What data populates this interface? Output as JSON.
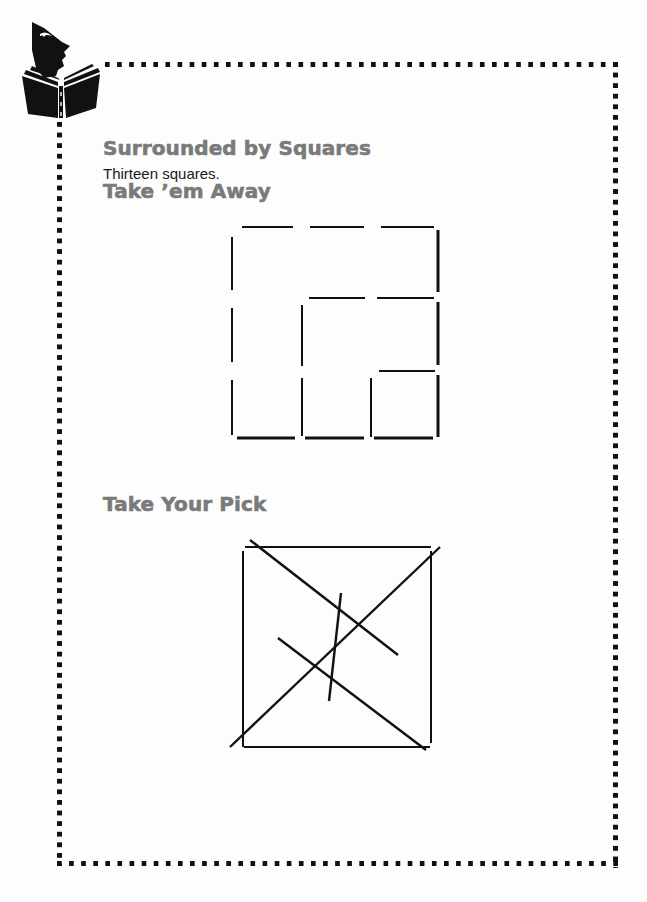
{
  "page": {
    "sections": [
      {
        "title": "Surrounded by Squares",
        "answer": "Thirteen squares."
      },
      {
        "title": "Take ’em Away"
      },
      {
        "title": "Take Your Pick"
      }
    ],
    "logo_icon": "person-reading-book-icon",
    "border_style": "dotted-square",
    "colors": {
      "heading": "#7a7a7a",
      "text": "#1a1a1a",
      "lines": "#111111",
      "background": "#fdfdfd"
    }
  },
  "figures": {
    "take_em_away": {
      "description": "Matchstick grid of 3x3 squares with some sticks rearranged",
      "stick_count": 22
    },
    "take_your_pick": {
      "description": "Square with four diagonal crossing lines forming a small inner square",
      "line_count": 8
    }
  }
}
